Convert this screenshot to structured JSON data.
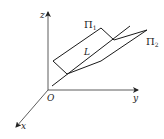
{
  "diagram": {
    "axes": {
      "z_label": "z",
      "y_label": "y",
      "x_label": "x",
      "origin_label": "O"
    },
    "plane1": {
      "symbol": "Π",
      "subscript": "1"
    },
    "plane2": {
      "symbol": "Π",
      "subscript": "2"
    },
    "line_label": "L",
    "colors": {
      "stroke": "#1a1a1a",
      "background": "#ffffff"
    }
  }
}
